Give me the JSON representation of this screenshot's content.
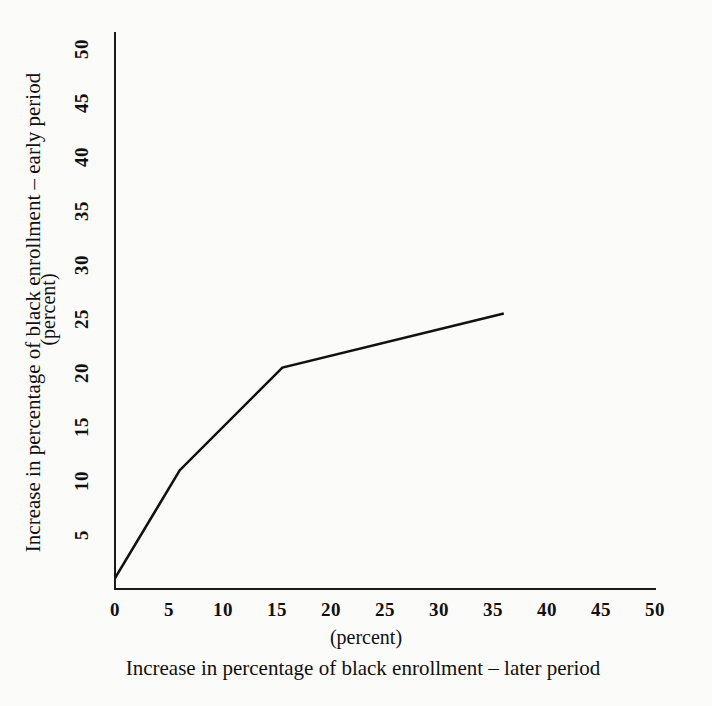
{
  "chart_data": {
    "type": "line",
    "title": "",
    "xlabel": "Increase in percentage of black enrollment – later period",
    "ylabel": "Increase in percentage of black enrollment – early period",
    "x_unit_caption": "(percent)",
    "y_unit_caption": "(percent)",
    "xlim": [
      0,
      50
    ],
    "ylim": [
      0,
      51.5
    ],
    "xticks": [
      0,
      5,
      10,
      15,
      20,
      25,
      30,
      35,
      40,
      45,
      50
    ],
    "xtick_labels": [
      "0",
      "5",
      "10",
      "15",
      "20",
      "25",
      "30",
      "35",
      "40",
      "45",
      "50"
    ],
    "yticks": [
      5,
      10,
      15,
      20,
      25,
      30,
      35,
      40,
      45,
      50
    ],
    "ytick_labels": [
      "5",
      "10",
      "15",
      "20",
      "25",
      "30",
      "35",
      "40",
      "45",
      "50"
    ],
    "grid": false,
    "legend": false,
    "line_color": "#111111",
    "background_color": "#fbfbfa",
    "series": [
      {
        "name": "black enrollment increase",
        "x": [
          0,
          6,
          15.5,
          36
        ],
        "y": [
          1,
          11,
          20.5,
          25.5
        ]
      }
    ]
  }
}
